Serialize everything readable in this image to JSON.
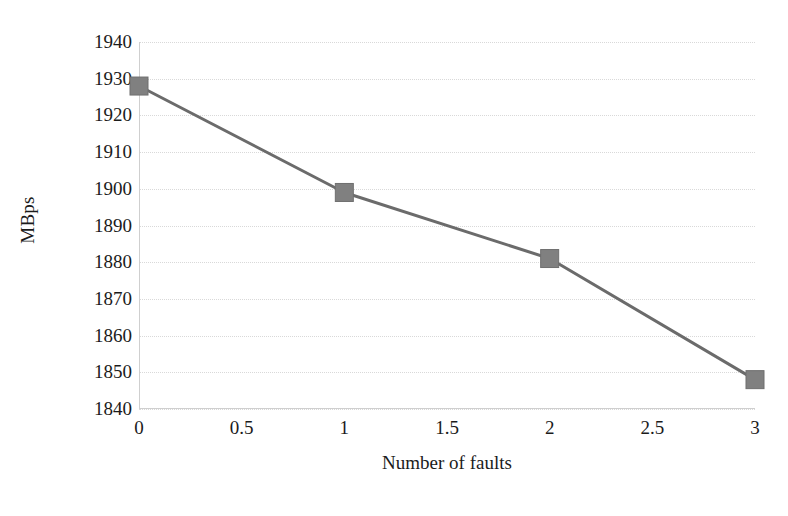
{
  "chart_data": {
    "type": "line",
    "title": "",
    "subtitle": "",
    "xlabel": "Number of faults",
    "ylabel": "MBps",
    "x": [
      0,
      1,
      2,
      3
    ],
    "values": [
      1928,
      1899,
      1881,
      1848
    ],
    "series": [
      {
        "name": "MBps",
        "x": [
          0,
          1,
          2,
          3
        ],
        "values": [
          1928,
          1899,
          1881,
          1848
        ]
      }
    ],
    "xlim": [
      0,
      3
    ],
    "ylim": [
      1840,
      1940
    ],
    "x_ticks": [
      "0",
      "0.5",
      "1",
      "1.5",
      "2",
      "2.5",
      "3"
    ],
    "x_tick_values": [
      0,
      0.5,
      1,
      1.5,
      2,
      2.5,
      3
    ],
    "y_ticks": [
      "1940",
      "1930",
      "1920",
      "1910",
      "1900",
      "1890",
      "1880",
      "1870",
      "1860",
      "1850",
      "1840"
    ],
    "y_tick_values": [
      1940,
      1930,
      1920,
      1910,
      1900,
      1890,
      1880,
      1870,
      1860,
      1850,
      1840
    ],
    "grid": true,
    "grid_axis": "y",
    "legend": false,
    "legend_position": "none",
    "marker": "square",
    "annotations": [],
    "colors": {
      "line": "#6b6b6b",
      "marker": "#808080",
      "marker_edge": "#6f6f6f",
      "grid": "#d9d9d9",
      "axis": "#cfcfcf",
      "text": "#1b1b1b",
      "background": "#ffffff"
    }
  }
}
